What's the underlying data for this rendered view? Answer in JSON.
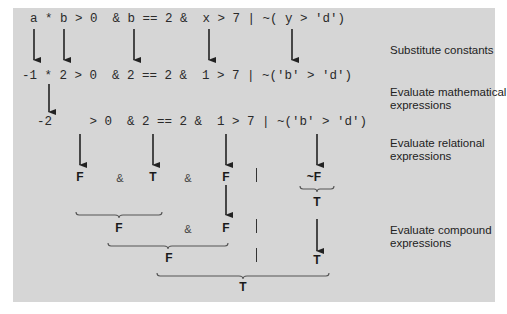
{
  "rows": {
    "r1": "a * b > 0  & b == 2 &  x > 7 | ~( y > 'd')",
    "r2": "-1 * 2 > 0  & 2 == 2 &  1 > 7 | ~('b' > 'd')",
    "r3": "-2     > 0  & 2 == 2 &  1 > 7 | ~('b' > 'd')"
  },
  "relational_results": {
    "a": "F",
    "amp1": "&",
    "b": "T",
    "amp2": "&",
    "c": "F",
    "or": "|",
    "not": "~F",
    "not_result": "T"
  },
  "compound_step1": {
    "a": "F",
    "amp": "&",
    "b": "F",
    "or": "|",
    "c": "T"
  },
  "compound_step2": {
    "a": "F",
    "or": "|"
  },
  "final_result": "T",
  "steps": {
    "s1": "Substitute constants",
    "s2a": "Evaluate mathematical",
    "s2b": "expressions",
    "s3a": "Evaluate relational",
    "s3b": "expressions",
    "s4a": "Evaluate compound",
    "s4b": "expressions"
  },
  "colors": {
    "panel": "#d6d6d6",
    "ink": "#2a2a2a"
  }
}
